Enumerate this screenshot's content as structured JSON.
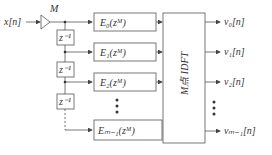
{
  "input": {
    "label": "x[n]"
  },
  "decimation": {
    "label": "M"
  },
  "delays": [
    {
      "label": "z⁻¹"
    },
    {
      "label": "z⁻¹"
    },
    {
      "label": "z⁻¹"
    }
  ],
  "filters": [
    {
      "label": "E₀(zᴹ)"
    },
    {
      "label": "E₁(zᴹ)"
    },
    {
      "label": "E₂(zᴹ)"
    },
    {
      "label": "Eₘ₋₁(zᴹ)"
    }
  ],
  "transform": {
    "label": "M点 IDFT"
  },
  "outputs": [
    {
      "label": "v₀[n]"
    },
    {
      "label": "v₁[n]"
    },
    {
      "label": "v₂[n]"
    },
    {
      "label": "vₘ₋₁[n]"
    }
  ],
  "colors": {
    "line": "#555555",
    "text": "#333333"
  }
}
